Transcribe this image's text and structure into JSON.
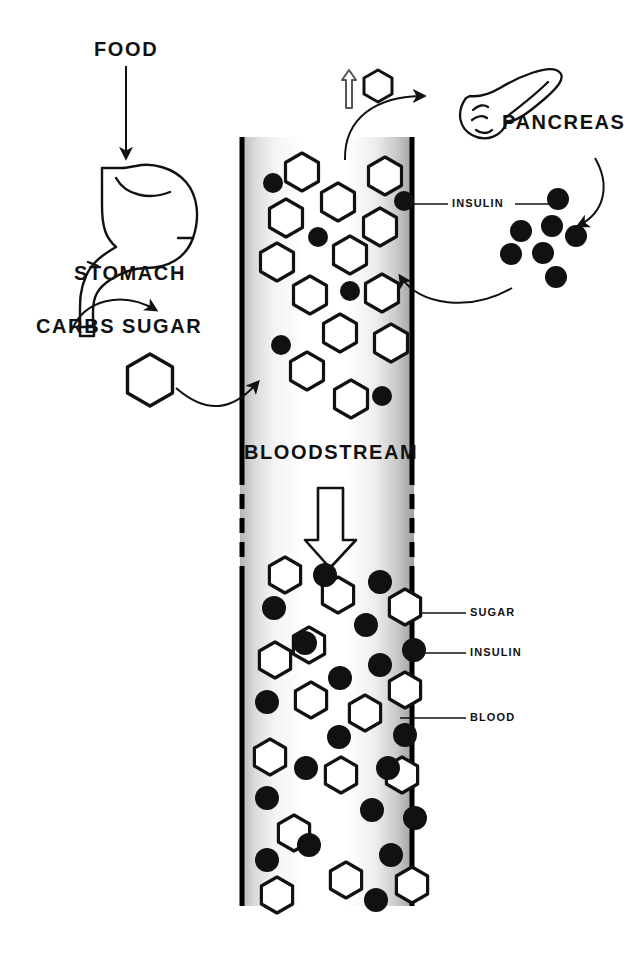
{
  "diagram": {
    "title_labels": {
      "food": "FOOD",
      "stomach": "STOMACH",
      "carbs": "CARBS",
      "sugar_word": "SUGAR",
      "pancreas": "PANCREAS",
      "bloodstream": "BLOODSTREAM"
    },
    "callouts": {
      "insulin_top": "INSULIN",
      "sugar_legend": "SUGAR",
      "insulin_legend": "INSULIN",
      "blood_legend": "BLOOD"
    },
    "icons": {
      "food_arrow": "arrow-down-icon",
      "stomach": "stomach-organ-icon",
      "pancreas": "pancreas-organ-icon",
      "carbs_to_sugar_arrow": "curved-arrow-right-icon",
      "sugar_to_vessel_arrow": "curved-arrow-right-icon",
      "sugar_rising_arrow": "arrow-up-hollow-icon",
      "sugar_signal_arrow": "curved-arrow-right-icon",
      "insulin_release_arrow": "curved-arrow-left-icon",
      "pancreas_to_insulin_arrow": "curved-arrow-down-icon",
      "bloodstream_arrow": "arrow-down-hollow-icon",
      "sugar_molecule": "hexagon-icon",
      "insulin_molecule": "filled-circle-icon"
    },
    "colors": {
      "ink": "#111111",
      "vessel_wall": "#000000",
      "vessel_plasma": "#ffffff",
      "vessel_shade": "#b9b9b9",
      "background": "#ffffff"
    },
    "vessel": {
      "left_x": 240,
      "right_x": 414,
      "top_y": 137,
      "bottom_y": 906,
      "dash_gap_top": 470,
      "dash_gap_bottom": 572
    },
    "free_sugar_molecule": {
      "label": "sugar-hexagon-free",
      "cx": 150,
      "cy": 380,
      "r": 26
    },
    "rising_sugar": {
      "arrow_x": 349,
      "arrow_y": 88,
      "hex_cx": 378,
      "hex_cy": 86,
      "hex_r": 16
    },
    "pancreas_insulin_cluster": [
      {
        "cx": 558,
        "cy": 199,
        "r": 11
      },
      {
        "cx": 552,
        "cy": 226,
        "r": 11
      },
      {
        "cx": 521,
        "cy": 231,
        "r": 11
      },
      {
        "cx": 576,
        "cy": 236,
        "r": 11
      },
      {
        "cx": 511,
        "cy": 254,
        "r": 11
      },
      {
        "cx": 543,
        "cy": 253,
        "r": 11
      },
      {
        "cx": 556,
        "cy": 277,
        "r": 11
      }
    ],
    "upper_vessel_sugars": [
      {
        "cx": 302,
        "cy": 172,
        "r": 19
      },
      {
        "cx": 385,
        "cy": 176,
        "r": 19
      },
      {
        "cx": 338,
        "cy": 202,
        "r": 19
      },
      {
        "cx": 286,
        "cy": 218,
        "r": 19
      },
      {
        "cx": 380,
        "cy": 227,
        "r": 19
      },
      {
        "cx": 277,
        "cy": 262,
        "r": 19
      },
      {
        "cx": 350,
        "cy": 255,
        "r": 19
      },
      {
        "cx": 310,
        "cy": 295,
        "r": 19
      },
      {
        "cx": 382,
        "cy": 293,
        "r": 19
      },
      {
        "cx": 340,
        "cy": 333,
        "r": 19
      },
      {
        "cx": 391,
        "cy": 343,
        "r": 19
      },
      {
        "cx": 307,
        "cy": 371,
        "r": 19
      },
      {
        "cx": 351,
        "cy": 399,
        "r": 19
      }
    ],
    "upper_vessel_insulins": [
      {
        "cx": 273,
        "cy": 183,
        "r": 10
      },
      {
        "cx": 404,
        "cy": 201,
        "r": 10
      },
      {
        "cx": 318,
        "cy": 237,
        "r": 10
      },
      {
        "cx": 350,
        "cy": 291,
        "r": 10
      },
      {
        "cx": 281,
        "cy": 345,
        "r": 10
      },
      {
        "cx": 382,
        "cy": 396,
        "r": 10
      }
    ],
    "lower_vessel_sugars": [
      {
        "cx": 285,
        "cy": 575,
        "r": 18
      },
      {
        "cx": 338,
        "cy": 595,
        "r": 18
      },
      {
        "cx": 405,
        "cy": 607,
        "r": 18
      },
      {
        "cx": 275,
        "cy": 660,
        "r": 18
      },
      {
        "cx": 309,
        "cy": 645,
        "r": 18
      },
      {
        "cx": 405,
        "cy": 690,
        "r": 18
      },
      {
        "cx": 311,
        "cy": 700,
        "r": 18
      },
      {
        "cx": 365,
        "cy": 713,
        "r": 18
      },
      {
        "cx": 270,
        "cy": 757,
        "r": 18
      },
      {
        "cx": 341,
        "cy": 775,
        "r": 18
      },
      {
        "cx": 402,
        "cy": 775,
        "r": 18
      },
      {
        "cx": 294,
        "cy": 833,
        "r": 18
      },
      {
        "cx": 346,
        "cy": 880,
        "r": 18
      },
      {
        "cx": 412,
        "cy": 885,
        "r": 18
      },
      {
        "cx": 277,
        "cy": 895,
        "r": 18
      }
    ],
    "lower_vessel_insulins": [
      {
        "cx": 325,
        "cy": 575,
        "r": 12
      },
      {
        "cx": 380,
        "cy": 582,
        "r": 12
      },
      {
        "cx": 274,
        "cy": 608,
        "r": 12
      },
      {
        "cx": 366,
        "cy": 625,
        "r": 12
      },
      {
        "cx": 305,
        "cy": 643,
        "r": 12
      },
      {
        "cx": 380,
        "cy": 665,
        "r": 12
      },
      {
        "cx": 414,
        "cy": 650,
        "r": 12
      },
      {
        "cx": 340,
        "cy": 678,
        "r": 12
      },
      {
        "cx": 267,
        "cy": 702,
        "r": 12
      },
      {
        "cx": 339,
        "cy": 737,
        "r": 12
      },
      {
        "cx": 405,
        "cy": 735,
        "r": 12
      },
      {
        "cx": 306,
        "cy": 768,
        "r": 12
      },
      {
        "cx": 388,
        "cy": 768,
        "r": 12
      },
      {
        "cx": 267,
        "cy": 798,
        "r": 12
      },
      {
        "cx": 372,
        "cy": 810,
        "r": 12
      },
      {
        "cx": 415,
        "cy": 818,
        "r": 12
      },
      {
        "cx": 309,
        "cy": 845,
        "r": 12
      },
      {
        "cx": 267,
        "cy": 860,
        "r": 12
      },
      {
        "cx": 391,
        "cy": 855,
        "r": 12
      },
      {
        "cx": 376,
        "cy": 900,
        "r": 12
      }
    ]
  }
}
